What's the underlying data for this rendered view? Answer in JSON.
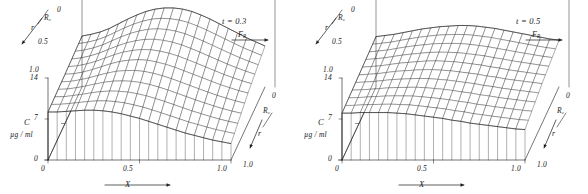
{
  "figure": {
    "panels": [
      {
        "id": "panel-left",
        "annotation_t": "t = 0.3",
        "flow_label": "F",
        "flow_label_sub": "R",
        "axes": {
          "x": {
            "label": "X",
            "ticks": [
              "0",
              "0.5",
              "1.0"
            ]
          },
          "z": {
            "label": "C",
            "units": "µg / ml",
            "ticks": [
              "0",
              "7",
              "14"
            ]
          },
          "r_left": {
            "label": "r",
            "ticks": [
              "R",
              "0.5",
              "1.0"
            ],
            "top_tick": "0",
            "rc_sub": "c"
          },
          "r_right": {
            "label": "r",
            "top_tick": "0",
            "rc_label": "R",
            "rc_sub": "c",
            "bottom_tick": "1.0"
          }
        },
        "surface": {
          "peak_height": 0.96,
          "front_edge_height": 0.62,
          "back_ridge_x": 0.55,
          "nx": 20,
          "nr": 10
        }
      },
      {
        "id": "panel-right",
        "annotation_t": "t = 0.5",
        "flow_label": "F",
        "flow_label_sub": "R",
        "axes": {
          "x": {
            "label": "X",
            "ticks": [
              "0",
              "0.5",
              "1.0"
            ]
          },
          "z": {
            "label": "C",
            "units": "µg / ml",
            "ticks": [
              "0",
              "7",
              "14"
            ]
          },
          "r_left": {
            "label": "r",
            "ticks": [
              "R",
              "0.5",
              "1.0"
            ],
            "top_tick": "0",
            "rc_sub": "c"
          },
          "r_right": {
            "label": "r",
            "top_tick": "0",
            "rc_label": "R",
            "rc_sub": "c",
            "bottom_tick": "1.0"
          }
        },
        "surface": {
          "peak_height": 0.72,
          "front_edge_height": 0.5,
          "back_ridge_x": 0.52,
          "nx": 20,
          "nr": 10
        }
      }
    ]
  },
  "chart_data": {
    "type": "line",
    "title": "",
    "xlabel": "X",
    "ylabel": "r",
    "zlabel": "C",
    "zunits": "µg / ml",
    "xlim": [
      0,
      1.0
    ],
    "xticks": [
      0,
      0.5,
      1.0
    ],
    "rlim": [
      0,
      1.0
    ],
    "rticks": [
      0,
      0.5,
      1.0
    ],
    "rtick_labels": [
      "R_c",
      "0.5",
      "1.0"
    ],
    "zlim": [
      0,
      14
    ],
    "zticks": [
      0,
      7,
      14
    ],
    "grid": false,
    "legend": "none",
    "annotations": [
      "t = 0.3",
      "t = 0.5",
      "F_R"
    ],
    "panels": [
      {
        "name": "t = 0.3",
        "annotation": "t = 0.3",
        "x": [
          0.0,
          0.05,
          0.1,
          0.15,
          0.2,
          0.25,
          0.3,
          0.35,
          0.4,
          0.45,
          0.5,
          0.55,
          0.6,
          0.65,
          0.7,
          0.75,
          0.8,
          0.85,
          0.9,
          0.95,
          1.0
        ],
        "series": [
          {
            "name": "r = R_c (back edge)",
            "r": 0.0,
            "values": [
              8.7,
              9.0,
              9.4,
              10.0,
              10.8,
              11.6,
              12.3,
              12.9,
              13.3,
              13.5,
              13.5,
              13.3,
              12.9,
              12.3,
              11.6,
              10.8,
              10.0,
              9.2,
              8.4,
              7.7,
              7.0
            ]
          },
          {
            "name": "r = 0.5",
            "r": 0.5,
            "values": [
              8.4,
              8.5,
              8.8,
              9.2,
              9.7,
              10.2,
              10.6,
              10.8,
              10.9,
              10.8,
              10.5,
              10.1,
              9.6,
              9.0,
              8.4,
              7.8,
              7.2,
              6.6,
              6.1,
              5.6,
              5.2
            ]
          },
          {
            "name": "r = 1.0 (front edge)",
            "r": 1.0,
            "values": [
              8.2,
              8.2,
              8.3,
              8.4,
              8.5,
              8.5,
              8.4,
              8.2,
              7.9,
              7.5,
              7.1,
              6.6,
              6.1,
              5.6,
              5.1,
              4.6,
              4.2,
              3.8,
              3.4,
              3.1,
              2.8
            ]
          }
        ]
      },
      {
        "name": "t = 0.5",
        "annotation": "t = 0.5",
        "x": [
          0.0,
          0.05,
          0.1,
          0.15,
          0.2,
          0.25,
          0.3,
          0.35,
          0.4,
          0.45,
          0.5,
          0.55,
          0.6,
          0.65,
          0.7,
          0.75,
          0.8,
          0.85,
          0.9,
          0.95,
          1.0
        ],
        "series": [
          {
            "name": "r = R_c (back edge)",
            "r": 0.0,
            "values": [
              8.6,
              8.8,
              9.0,
              9.3,
              9.6,
              9.9,
              10.1,
              10.3,
              10.4,
              10.5,
              10.5,
              10.4,
              10.2,
              10.0,
              9.7,
              9.4,
              9.1,
              8.8,
              8.5,
              8.2,
              8.0
            ]
          },
          {
            "name": "r = 0.5",
            "r": 0.5,
            "values": [
              8.3,
              8.4,
              8.5,
              8.7,
              8.9,
              9.0,
              9.1,
              9.2,
              9.2,
              9.1,
              9.0,
              8.8,
              8.6,
              8.4,
              8.1,
              7.9,
              7.6,
              7.4,
              7.2,
              7.0,
              6.8
            ]
          },
          {
            "name": "r = 1.0 (front edge)",
            "r": 1.0,
            "values": [
              8.0,
              8.0,
              8.1,
              8.1,
              8.1,
              8.1,
              8.0,
              7.9,
              7.7,
              7.5,
              7.3,
              7.1,
              6.8,
              6.6,
              6.3,
              6.1,
              5.9,
              5.7,
              5.5,
              5.3,
              5.2
            ]
          }
        ]
      }
    ]
  }
}
